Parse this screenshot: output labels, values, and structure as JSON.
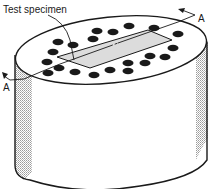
{
  "figure": {
    "labels": {
      "specimen": "Test specimen",
      "section_marker_right": "A",
      "section_marker_left": "A"
    },
    "colors": {
      "ink": "#1a1a1a",
      "shade": "#cfcfcf",
      "specimen_fill": "#dcdcdc",
      "background": "#ffffff"
    },
    "holes": [
      [
        129,
        26
      ],
      [
        154,
        28
      ],
      [
        97,
        31
      ],
      [
        113,
        32
      ],
      [
        178,
        34
      ],
      [
        58,
        42
      ],
      [
        93,
        39
      ],
      [
        73,
        45
      ],
      [
        173,
        48
      ],
      [
        53,
        52
      ],
      [
        150,
        56
      ],
      [
        165,
        57
      ],
      [
        47,
        62
      ],
      [
        128,
        63
      ],
      [
        145,
        63
      ],
      [
        48,
        73
      ],
      [
        59,
        68
      ],
      [
        75,
        72
      ],
      [
        94,
        75
      ],
      [
        110,
        70
      ],
      [
        128,
        71
      ]
    ]
  }
}
